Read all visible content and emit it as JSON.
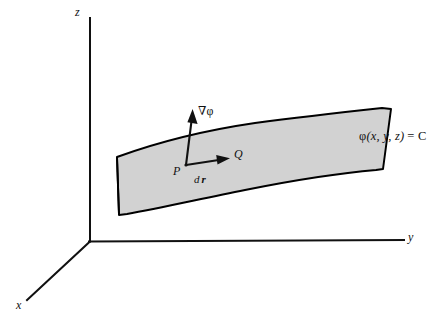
{
  "figure": {
    "kind": "vector-calculus-3d-diagram",
    "title_text": "",
    "background_color": "#ffffff",
    "ink_color": "#111111",
    "surface_fill_color": "#d2d2d2",
    "surface_stroke_color": "#000000"
  },
  "axes": {
    "origin_label": "",
    "z_label": "z",
    "y_label": "y",
    "x_label": "x"
  },
  "annotations": {
    "gradient_label": "∇φ",
    "point_p_label": "P",
    "point_q_label": "Q",
    "displacement_label_d": "d",
    "displacement_label_r": "r",
    "surface_equation_phi": "φ",
    "surface_equation_args": "(x, y, z)",
    "surface_equation_rhs": "= C"
  },
  "caption": {
    "text": ""
  }
}
